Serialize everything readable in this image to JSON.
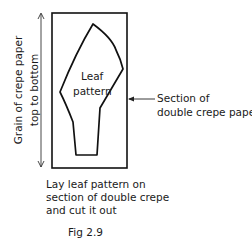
{
  "figure": {
    "caption": "Fig 2.9",
    "leaf_label_line1": "Leaf",
    "leaf_label_line2": "pattern",
    "section_label_line1": "Section of",
    "section_label_line2": "double crepe paper",
    "grain_label_line1": "Grain of crepe paper",
    "grain_label_line2": "top to bottom",
    "instruction_lines": [
      "Lay leaf pattern on",
      "section of double crepe",
      "and cut it out"
    ]
  },
  "colors": {
    "line": "#111111",
    "background": "#ffffff"
  }
}
